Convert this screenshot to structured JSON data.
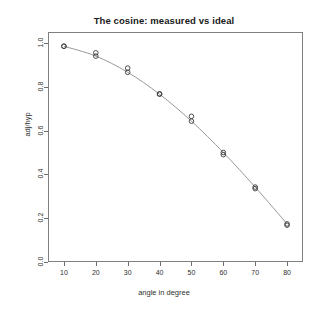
{
  "chart_data": {
    "type": "scatter",
    "title": "The cosine: measured vs ideal",
    "xlabel": "angle in degree",
    "ylabel": "adj/hyp",
    "xlim": [
      5,
      85
    ],
    "ylim": [
      0.0,
      1.05
    ],
    "grid": false,
    "legend": "none",
    "xticks": [
      10,
      20,
      30,
      40,
      50,
      60,
      70,
      80
    ],
    "xtick_labels": [
      "10",
      "20",
      "30",
      "40",
      "50",
      "60",
      "70",
      "80"
    ],
    "yticks": [
      0.0,
      0.2,
      0.4,
      0.6,
      0.8,
      1.0
    ],
    "ytick_labels": [
      "0.0",
      "0.2",
      "0.4",
      "0.6",
      "0.8",
      "1.0"
    ],
    "x": [
      10,
      20,
      30,
      40,
      50,
      60,
      70,
      80
    ],
    "series": [
      {
        "name": "ideal",
        "marker": "circle-open",
        "line": "solid",
        "values": [
          0.985,
          0.94,
          0.866,
          0.766,
          0.643,
          0.5,
          0.342,
          0.174
        ]
      },
      {
        "name": "measured",
        "marker": "circle-open",
        "line": "none",
        "values": [
          0.985,
          0.955,
          0.885,
          0.768,
          0.665,
          0.49,
          0.335,
          0.168
        ]
      }
    ]
  },
  "colors": {
    "line": "#8c8c8c",
    "marker": "#3a3a3a",
    "axis": "#808080",
    "text": "#303030",
    "title": "#1a1a1a",
    "background": "#ffffff"
  }
}
